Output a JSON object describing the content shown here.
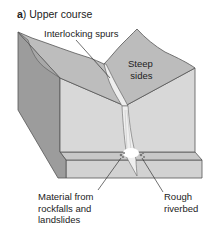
{
  "title": {
    "letter": "a",
    "text": ") Upper course"
  },
  "labels": {
    "interlocking_spurs": "Interlocking spurs",
    "steep_sides_line1": "Steep",
    "steep_sides_line2": "sides",
    "material_line1": "Material from",
    "material_line2": "rockfalls and",
    "material_line3": "landslides",
    "rough_line1": "Rough",
    "rough_line2": "riverbed"
  },
  "colors": {
    "front_face": "#d6d6d6",
    "top_surface": "#bdbdbd",
    "side_dark": "#9a9a9a",
    "base_slab": "#cfcfcf",
    "river": "#eeeeee",
    "outline": "#555555"
  }
}
